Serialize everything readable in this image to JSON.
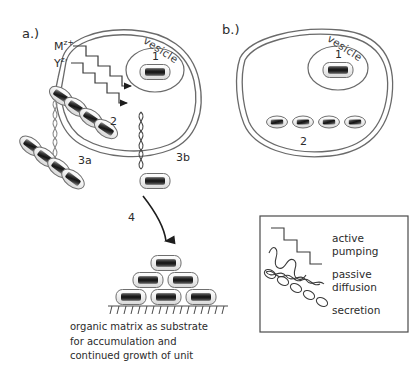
{
  "figure": {
    "type": "diagram",
    "background_color": "#ffffff",
    "ink_color": "#2b2b2b"
  },
  "panel_a": {
    "label": "a.)",
    "cell_label_vesicle": "vesicle",
    "ions": {
      "cation_base": "M",
      "cation_sup": "z+",
      "anion_base": "Y",
      "anion_sup": "z-"
    },
    "numbers": {
      "vesicle_unit": "1",
      "intracellular_chain": "2",
      "extracellular_chain": "3a",
      "secreted_unit": "3b",
      "deposition_arrow": "4"
    }
  },
  "panel_b": {
    "label": "b.)",
    "cell_label_vesicle": "vesicle",
    "numbers": {
      "vesicle_unit": "1",
      "unit_row": "2"
    },
    "unit_row_count": 4
  },
  "caption": {
    "line1": "organic matrix as substrate",
    "line2": "for accumulation and",
    "line3": "continued growth of unit"
  },
  "legend": {
    "items": [
      {
        "icon": "staircase-icon",
        "label_line1": "active",
        "label_line2": "pumping"
      },
      {
        "icon": "wave-icon",
        "label_line1": "passive",
        "label_line2": "diffusion"
      },
      {
        "icon": "helix-icon",
        "label_line1": "secretion",
        "label_line2": ""
      }
    ]
  },
  "colors": {
    "outline": "#555555",
    "membrane": "#6a6a6a",
    "unit_core": "#2a2a2a",
    "unit_shell": "#ffffff",
    "hatch": "#4a4a4a"
  }
}
